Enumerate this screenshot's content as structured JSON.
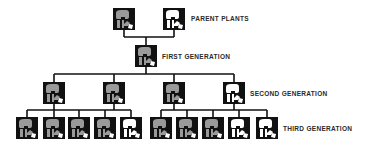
{
  "labels": {
    "parent": "PARENT PLANTS",
    "first": "FIRST GENERATION",
    "second": "SECOND GENERATION",
    "third": "THIRD GENERATION"
  },
  "colors": {
    "grey_flower": "#9a9a9a",
    "white_flower": "#ffffff",
    "box": "#111111",
    "line": "#111111"
  },
  "generations": {
    "parent": [
      {
        "x": 113,
        "y": 8,
        "flower": "grey"
      },
      {
        "x": 163,
        "y": 8,
        "flower": "white"
      }
    ],
    "first": [
      {
        "x": 135,
        "y": 45,
        "flower": "grey"
      }
    ],
    "second": [
      {
        "x": 43,
        "y": 82,
        "flower": "grey"
      },
      {
        "x": 103,
        "y": 82,
        "flower": "grey"
      },
      {
        "x": 163,
        "y": 82,
        "flower": "grey"
      },
      {
        "x": 223,
        "y": 82,
        "flower": "white"
      }
    ],
    "third": [
      {
        "x": 16,
        "y": 117,
        "flower": "grey"
      },
      {
        "x": 43,
        "y": 117,
        "flower": "grey"
      },
      {
        "x": 68,
        "y": 117,
        "flower": "grey"
      },
      {
        "x": 94,
        "y": 117,
        "flower": "grey"
      },
      {
        "x": 120,
        "y": 117,
        "flower": "white"
      },
      {
        "x": 150,
        "y": 117,
        "flower": "grey"
      },
      {
        "x": 176,
        "y": 117,
        "flower": "grey"
      },
      {
        "x": 202,
        "y": 117,
        "flower": "grey"
      },
      {
        "x": 228,
        "y": 117,
        "flower": "white"
      },
      {
        "x": 256,
        "y": 117,
        "flower": "white"
      }
    ]
  },
  "label_positions": {
    "parent": {
      "x": 191,
      "y": 15
    },
    "first": {
      "x": 162,
      "y": 53
    },
    "second": {
      "x": 250,
      "y": 90
    },
    "third": {
      "x": 283,
      "y": 125
    }
  }
}
